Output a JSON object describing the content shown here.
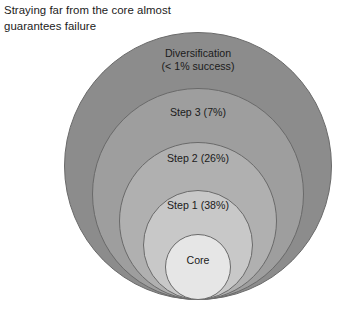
{
  "figure": {
    "caption": "Straying far from the core almost\nguarantees failure",
    "diagram_type": "nested-concentric-circles",
    "alignment": "circles tangent at bottom edge",
    "rings": [
      {
        "id": "diversification",
        "label": "Diversification\n(< 1% success)",
        "success_rate_percent": 1,
        "success_rate_text": "< 1%",
        "fill": "#8c8c8c",
        "stroke": "#6a6a6a",
        "diameter_px": 268,
        "center_x_px": 198,
        "bottom_y_px": 300,
        "label_y_px": 47
      },
      {
        "id": "step-3",
        "label": "Step 3 (7%)",
        "success_rate_percent": 7,
        "success_rate_text": "7%",
        "fill": "#9e9e9e",
        "stroke": "#6a6a6a",
        "diameter_px": 212,
        "center_x_px": 198,
        "bottom_y_px": 300,
        "label_y_px": 106
      },
      {
        "id": "step-2",
        "label": "Step 2 (26%)",
        "success_rate_percent": 26,
        "success_rate_text": "26%",
        "fill": "#b0b0b0",
        "stroke": "#6a6a6a",
        "diameter_px": 158,
        "center_x_px": 198,
        "bottom_y_px": 300,
        "label_y_px": 152
      },
      {
        "id": "step-1",
        "label": "Step 1 (38%)",
        "success_rate_percent": 38,
        "success_rate_text": "38%",
        "fill": "#c8c8c8",
        "stroke": "#6a6a6a",
        "diameter_px": 110,
        "center_x_px": 198,
        "bottom_y_px": 300,
        "label_y_px": 199
      },
      {
        "id": "core",
        "label": "Core",
        "success_rate_percent": null,
        "success_rate_text": "",
        "fill": "#e6e6e6",
        "stroke": "#6a6a6a",
        "diameter_px": 66,
        "center_x_px": 198,
        "bottom_y_px": 300,
        "label_y_px": 254
      }
    ]
  }
}
